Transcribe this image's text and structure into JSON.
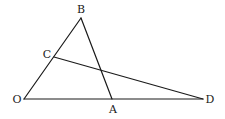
{
  "diagram": {
    "type": "geometry",
    "points": {
      "O": {
        "label": "O",
        "x": 24,
        "y": 99,
        "lx": 17,
        "ly": 103
      },
      "A": {
        "label": "A",
        "x": 112,
        "y": 99,
        "lx": 113,
        "ly": 113
      },
      "B": {
        "label": "B",
        "x": 81,
        "y": 18,
        "lx": 81,
        "ly": 13
      },
      "C": {
        "label": "C",
        "x": 54,
        "y": 57,
        "lx": 47,
        "ly": 58
      },
      "D": {
        "label": "D",
        "x": 203,
        "y": 99,
        "lx": 210,
        "ly": 103
      }
    },
    "segments": [
      {
        "from": "O",
        "to": "B"
      },
      {
        "from": "B",
        "to": "A"
      },
      {
        "from": "O",
        "to": "D"
      },
      {
        "from": "C",
        "to": "D"
      }
    ],
    "colors": {
      "stroke": "#1a1a1a",
      "background": "#ffffff"
    }
  }
}
